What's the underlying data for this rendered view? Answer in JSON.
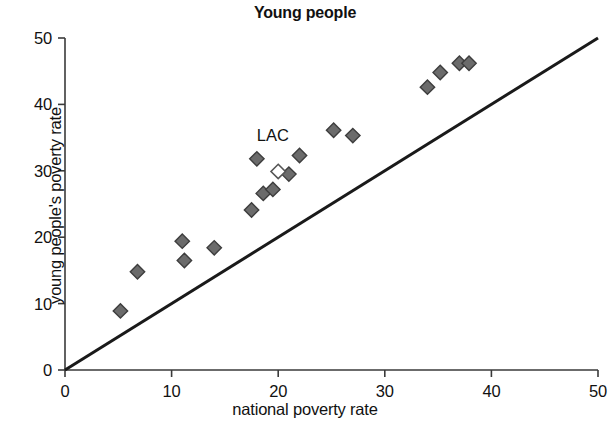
{
  "chart_data": {
    "type": "scatter",
    "title": "Young people",
    "xlabel": "national poverty rate",
    "ylabel": "young people's poverty rate",
    "xlim": [
      0,
      50
    ],
    "ylim": [
      0,
      50
    ],
    "xticks": [
      0,
      10,
      20,
      30,
      40,
      50
    ],
    "yticks": [
      0,
      10,
      20,
      30,
      40,
      50
    ],
    "xtick_labels": [
      "0",
      "10",
      "20",
      "30",
      "40",
      "50"
    ],
    "ytick_labels": [
      "0",
      "10",
      "20",
      "30",
      "40",
      "50"
    ],
    "grid": false,
    "legend": "none",
    "annotations": [
      {
        "text": "LAC",
        "x": 19.5,
        "y": 34.5
      }
    ],
    "reference_line": {
      "name": "45-degree line",
      "from": [
        0,
        0
      ],
      "to": [
        50,
        50
      ]
    },
    "series": [
      {
        "name": "countries",
        "marker": "diamond",
        "color": "#6b6b6b",
        "points": [
          {
            "x": 5.2,
            "y": 8.9
          },
          {
            "x": 6.8,
            "y": 14.8
          },
          {
            "x": 11.0,
            "y": 19.4
          },
          {
            "x": 11.2,
            "y": 16.5
          },
          {
            "x": 14.0,
            "y": 18.4
          },
          {
            "x": 17.5,
            "y": 24.1
          },
          {
            "x": 18.0,
            "y": 31.8
          },
          {
            "x": 18.6,
            "y": 26.6
          },
          {
            "x": 19.5,
            "y": 27.2
          },
          {
            "x": 21.0,
            "y": 29.5
          },
          {
            "x": 22.0,
            "y": 32.3
          },
          {
            "x": 25.2,
            "y": 36.1
          },
          {
            "x": 27.0,
            "y": 35.3
          },
          {
            "x": 34.0,
            "y": 42.6
          },
          {
            "x": 35.2,
            "y": 44.8
          },
          {
            "x": 37.0,
            "y": 46.2
          },
          {
            "x": 37.9,
            "y": 46.2
          }
        ]
      },
      {
        "name": "LAC",
        "marker": "diamond-open",
        "color": "#ffffff",
        "edge_color": "#555555",
        "points": [
          {
            "x": 20.0,
            "y": 29.9
          }
        ]
      }
    ]
  }
}
